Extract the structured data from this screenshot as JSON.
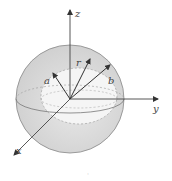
{
  "diagram": {
    "axes": {
      "x": "x",
      "y": "y",
      "z": "z"
    },
    "vectors": {
      "inner_radius": "a",
      "position": "r",
      "outer_radius": "b"
    },
    "colors": {
      "shell_fill": "#d6d6d6",
      "inner_fill": "#f4f4f4",
      "line": "#444444"
    },
    "footer_mark": "·"
  }
}
